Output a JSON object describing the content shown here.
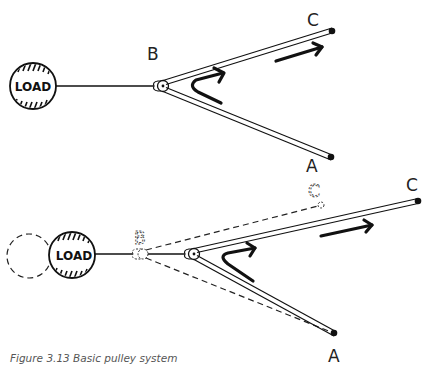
{
  "figure": {
    "caption": "Figure 3.13  Basic pulley system",
    "top_panel": {
      "load_label": "LOAD",
      "pulley_label": "B",
      "end_labels": {
        "upper": "C",
        "lower": "A"
      }
    },
    "bottom_panel": {
      "load_label": "LOAD",
      "previous_pulley_label": "B",
      "previous_end_label": "C",
      "end_labels": {
        "upper": "C",
        "lower": "A"
      }
    }
  }
}
